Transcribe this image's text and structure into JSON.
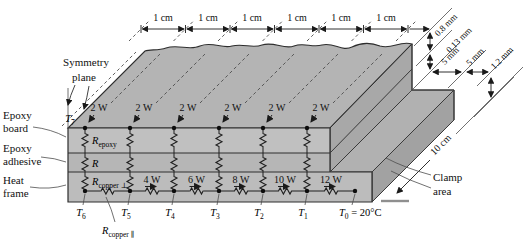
{
  "figure_title": "Epoxy board on heat frame with thermal resistance network",
  "colors": {
    "top_face": "#b4b4b4",
    "front_epoxy": "#c0c0c0",
    "front_adhesive": "#b6b6b6",
    "front_heat_frame": "#bcbcbc",
    "end_face_epoxy": "#a8a8a8",
    "clamp_strip": "#b1b1b1",
    "end_face_heat_frame": "#a2a2a2",
    "line": "#2e2e2e"
  },
  "top_dimension": {
    "labels": [
      "1 cm",
      "1 cm",
      "1 cm",
      "1 cm",
      "1 cm",
      "1 cm"
    ]
  },
  "right_dimensions": [
    "0.8 mm",
    "0.13 mm",
    "5 mm",
    "5 mm",
    "1.2 mm"
  ],
  "depth_dimension": "10 cm",
  "symmetry": {
    "line1": "Symmetry",
    "line2": "plane"
  },
  "layer_labels": {
    "epoxy_board": [
      "Epoxy",
      "board"
    ],
    "epoxy_adhesive": [
      "Epoxy",
      "adhesive"
    ],
    "heat_frame": [
      "Heat",
      "frame"
    ]
  },
  "clamp": {
    "line1": "Clamp",
    "line2": "area"
  },
  "heat_sources": [
    "2 W",
    "2 W",
    "2 W",
    "2 W",
    "2 W",
    "2 W"
  ],
  "flows": [
    "4 W",
    "6 W",
    "8 W",
    "10 W",
    "12 W"
  ],
  "resistors": {
    "epoxy": {
      "base": "R",
      "sub": "epoxy"
    },
    "adhesive": {
      "base": "R",
      "sub": ""
    },
    "copper_perp": {
      "base": "R",
      "sub": "copper ⊥"
    },
    "copper_par": {
      "base": "R",
      "sub": "copper ∥"
    }
  },
  "temps": {
    "t7": {
      "base": "T",
      "sub": "7"
    },
    "bottom": [
      {
        "base": "T",
        "sub": "6"
      },
      {
        "base": "T",
        "sub": "5"
      },
      {
        "base": "T",
        "sub": "4"
      },
      {
        "base": "T",
        "sub": "3"
      },
      {
        "base": "T",
        "sub": "2"
      },
      {
        "base": "T",
        "sub": "1"
      }
    ],
    "t0": {
      "base": "T",
      "sub": "0",
      "rest": " = 20°C"
    }
  }
}
